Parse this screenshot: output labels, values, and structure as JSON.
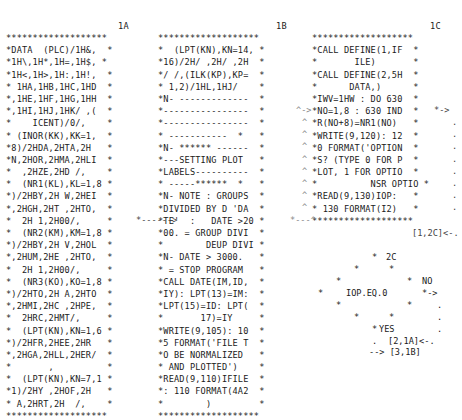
{
  "document": {
    "columns": [
      {
        "id": "1A",
        "label": "1A",
        "lines": [
          "*******************",
          "*DATA  (PLC)/1H&,  *",
          "*1H\\,1H*,1H=,1H$, *",
          "*1H<,1H>,1H:,1H!,  *",
          "* 1HA,1HB,1HC,1HD  *",
          "*,1HE,1HF,1HG,1HH  *",
          "*,1HI,1HJ,1HK/ ,(  *",
          "*    ICENT)/0/,    *",
          "* (INOR(KK),KK=1,  *",
          "*8)/2HDA,2HTA,2H   *",
          "*N,2HOR,2HMA,2HLI  *",
          "*  ,2HZE,2HD /,    *",
          "*  (NR1(KL),KL=1,8 *",
          "*)/2HBY,2H W,2HEI  *",
          "*,2HGH,2HT ,2HTO,  *",
          "*  2H 1,2H00/,     *",
          "*  (NR2(KM),KM=1,8 *",
          "*)/2HBY,2H V,2HOL  *",
          "*,2HUM,2HE ,2HTO,  *",
          "*  2H 1,2H00/,     *",
          "*  (NR3(KO),KO=1,8 *",
          "*)/2HTO,2H A,2HTO  *",
          "*,2HMI,2HC ,2HPE,  *",
          "*  2HRC,2HMT/,     *",
          "*  (LPT(KN),KN=1,6 *",
          "*)/2HFR,2HEE,2HR   *",
          "*,2HGA,2HLL,2HER/  *",
          "*       ,          *",
          "*  (LPT(KN),KN=7,1 *",
          "*1)/2HY ,2HOF,2H   *",
          "* A,2HRT,2H  /,    *",
          "*******************"
        ]
      },
      {
        "id": "1B",
        "label": "1B",
        "lines": [
          "*******************",
          "*  (LPT(KN),KN=14, *",
          "*16)/2H/ ,2H/ ,2H  *",
          "*/ /,(ILK(KP),KP=  *",
          "* 1,2)/1HL,1HJ/    *",
          "*N- -------------  *",
          "*----------------  *",
          "*----------------  *",
          "* -----------  *   *",
          "*N- ****** ------  *",
          "*---SETTING PLOT   *",
          "*LABELS----------  *",
          "* -----******  *   *",
          "*N- NOTE : GROUPS  *",
          "*DIVIDED BY D 'DA  *",
          "*TE'  :   DATE >20 *",
          "*00. = GROUP DIVI  *",
          "*        DEUP DIVI *",
          "*N- DATE > 3000.   *",
          "* = STOP PROGRAM   *",
          "*CALL DATE(IM,ID,  *",
          "*IY): LPT(13)=IM:  *",
          "*LPT(15)=ID: LPT(  *",
          "*       17)=IY     *",
          "*WRITE(9,105): 10  *",
          "*5 FORMAT('FILE T  *",
          "*O BE NORMALIZED   *",
          "* AND PLOTTED')    *",
          "*READ(9,110)IFILE  *",
          "*: 110 FORMAT(4A2  *",
          "*        )         *",
          "*******************"
        ]
      },
      {
        "id": "1C",
        "label": "1C",
        "lines": [
          "*******************",
          "*CALL DEFINE(1,IF  *",
          "*       ILE)       *",
          "*CALL DEFINE(2,5H  *",
          "*      DATA,)      *",
          "*IWV=1HW : DO 630  *",
          "*NO=1,8 : 630 IND  *",
          "*R(NO+8)=NR1(NO)   *",
          "*WRITE(9,120): 12  *",
          "*0 FORMAT('OPTION  *",
          "*S? (TYPE 0 FOR P  *",
          "*LOT, 1 FOR OPTIO  *",
          "*          NSR OPTIO *",
          "*READ(9,130)IOP:   *",
          "* 130 FORMAT(I2)   *",
          "*******************"
        ],
        "footer_ref": "[1,2C]<-."
      }
    ],
    "connectors": {
      "a_to_b": "*------>",
      "b_return": "*---^",
      "b_to_c": "^->",
      "c_out": "*->",
      "continuation_dots": "."
    },
    "decision": {
      "id": "2C",
      "label": "2C",
      "condition": "IOP.EQ.0",
      "no_label": "NO",
      "no_arrow": "*->",
      "yes_label": "YES",
      "ref_no": "[2,1A]<-.",
      "ref_yes": "--> [3,1B]"
    }
  }
}
